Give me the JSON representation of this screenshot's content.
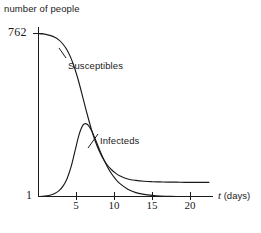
{
  "chart_data": {
    "type": "line",
    "title": "",
    "subtitle": "",
    "xlabel": "t (days)",
    "xlabel_symbol": "t",
    "xlabel_unit": "(days)",
    "ylabel": "number of people",
    "xlim": [
      0,
      21.5
    ],
    "ylim": [
      1,
      762
    ],
    "yscale": "linear",
    "grid": false,
    "legend": "inline-annotations",
    "xticks": [
      5,
      10,
      15,
      20
    ],
    "xticklabels": [
      "5",
      "10",
      "15",
      "20"
    ],
    "yticks": [
      1,
      762
    ],
    "yticklabels": [
      "1",
      "762"
    ],
    "annotations": [
      {
        "text": "Susceptibles",
        "x": 4.0,
        "y": 520
      },
      {
        "text": "Infecteds",
        "x": 8.2,
        "y": 250
      }
    ],
    "series": [
      {
        "name": "Susceptibles",
        "color": "#1a1a1a",
        "x": [
          0,
          0.5,
          1,
          1.5,
          2,
          2.5,
          3,
          3.5,
          4,
          4.5,
          5,
          5.5,
          6,
          6.5,
          7,
          7.5,
          8,
          8.5,
          9,
          9.5,
          10,
          11,
          12,
          13,
          14,
          15,
          16,
          17,
          18,
          19,
          20,
          21
        ],
        "values": [
          762,
          760,
          757,
          752,
          744,
          732,
          713,
          686,
          647,
          595,
          531,
          458,
          385,
          317,
          259,
          212,
          175,
          147,
          126,
          110,
          98,
          83,
          76,
          72,
          70,
          69,
          68,
          68,
          67,
          67,
          67,
          67
        ]
      },
      {
        "name": "Infecteds",
        "color": "#1a1a1a",
        "x": [
          0,
          0.5,
          1,
          1.5,
          2,
          2.5,
          3,
          3.5,
          4,
          4.5,
          5,
          5.5,
          6,
          6.5,
          7,
          7.5,
          8,
          8.5,
          9,
          9.5,
          10,
          11,
          12,
          13,
          14,
          15,
          16,
          17,
          18,
          19,
          20,
          21
        ],
        "values": [
          1,
          2,
          4,
          8,
          15,
          27,
          48,
          83,
          138,
          214,
          290,
          335,
          338,
          311,
          268,
          221,
          177,
          139,
          107,
          82,
          62,
          35,
          19,
          11,
          6,
          3,
          2,
          1,
          1,
          1,
          1,
          1
        ]
      }
    ]
  },
  "figure": {
    "background_color": "#ffffff",
    "ink_color": "#1a1a1a"
  }
}
